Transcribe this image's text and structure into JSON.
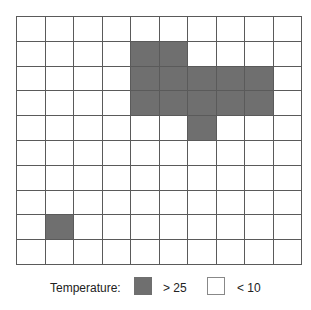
{
  "chart_data": {
    "type": "heatmap",
    "title": "",
    "rows": 10,
    "cols": 10,
    "cell_classes": {
      "hot": {
        "label": "> 25",
        "color": "#6f6f6f"
      },
      "cold": {
        "label": "< 10",
        "color": "#ffffff"
      }
    },
    "hot_cells": [
      [
        1,
        4
      ],
      [
        1,
        5
      ],
      [
        2,
        4
      ],
      [
        2,
        5
      ],
      [
        2,
        6
      ],
      [
        2,
        7
      ],
      [
        2,
        8
      ],
      [
        3,
        4
      ],
      [
        3,
        5
      ],
      [
        3,
        6
      ],
      [
        3,
        7
      ],
      [
        3,
        8
      ],
      [
        4,
        6
      ],
      [
        8,
        1
      ]
    ],
    "grid": [
      [
        0,
        0,
        0,
        0,
        0,
        0,
        0,
        0,
        0,
        0
      ],
      [
        0,
        0,
        0,
        0,
        1,
        1,
        0,
        0,
        0,
        0
      ],
      [
        0,
        0,
        0,
        0,
        1,
        1,
        1,
        1,
        1,
        0
      ],
      [
        0,
        0,
        0,
        0,
        1,
        1,
        1,
        1,
        1,
        0
      ],
      [
        0,
        0,
        0,
        0,
        0,
        0,
        1,
        0,
        0,
        0
      ],
      [
        0,
        0,
        0,
        0,
        0,
        0,
        0,
        0,
        0,
        0
      ],
      [
        0,
        0,
        0,
        0,
        0,
        0,
        0,
        0,
        0,
        0
      ],
      [
        0,
        0,
        0,
        0,
        0,
        0,
        0,
        0,
        0,
        0
      ],
      [
        0,
        1,
        0,
        0,
        0,
        0,
        0,
        0,
        0,
        0
      ],
      [
        0,
        0,
        0,
        0,
        0,
        0,
        0,
        0,
        0,
        0
      ]
    ],
    "legend": {
      "title": "Temperature:",
      "entries": [
        {
          "label": "> 25",
          "color": "#6f6f6f"
        },
        {
          "label": "< 10",
          "color": "#ffffff"
        }
      ],
      "position": "bottom"
    },
    "grid_line_color": "#5a5a5a"
  },
  "legend": {
    "title": "Temperature:",
    "hot_label": "> 25",
    "cold_label": "< 10"
  }
}
